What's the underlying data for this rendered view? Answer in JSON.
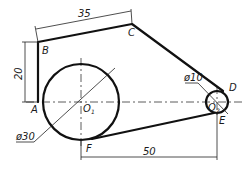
{
  "diagram": {
    "type": "engineering drawing",
    "points": {
      "A": "A",
      "B": "B",
      "C": "C",
      "D": "D",
      "E": "E",
      "F": "F",
      "O1": "O",
      "O1_sub": "1",
      "O2": "O",
      "O2_sub": "2"
    },
    "dimensions": {
      "top_length": "35",
      "left_height": "20",
      "small_diameter": "ø10",
      "large_diameter": "ø30",
      "bottom_length": "50"
    },
    "colors": {
      "line": "#111111",
      "background": "#ffffff"
    }
  }
}
